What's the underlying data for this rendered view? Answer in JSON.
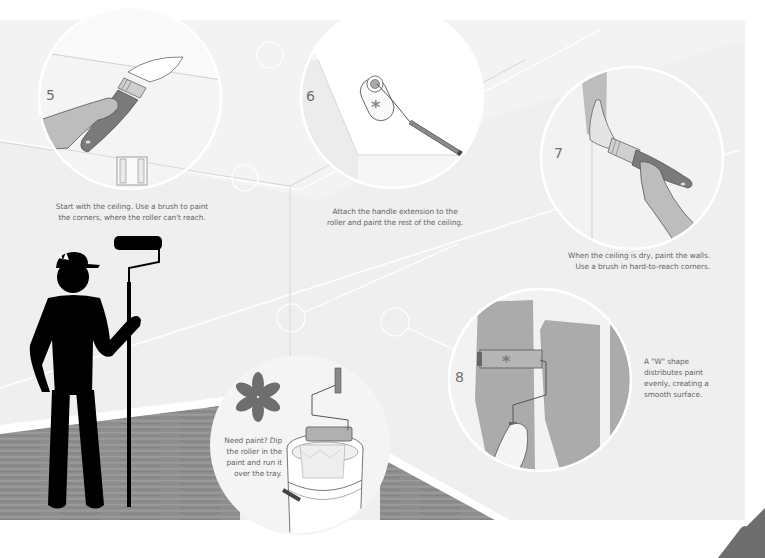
{
  "colors": {
    "background": "#ffffff",
    "wall": "#eeeeee",
    "wall_light": "#f5f5f5",
    "floor": "#8c8c8c",
    "floor_stripe": "#9a9a9a",
    "circle_fill": "#f8f8f8",
    "circle_border": "#ffffff",
    "paint_gray": "#a9a9a9",
    "accent_dark": "#6e6e6e",
    "silhouette": "#000000",
    "text": "#666666"
  },
  "steps": [
    {
      "number": "5",
      "caption_lines": [
        "Start with the ceiling. Use a brush to paint",
        "the corners, where the roller can't reach."
      ],
      "illustration": "hand-with-paintbrush-on-ceiling"
    },
    {
      "number": "6",
      "caption_lines": [
        "Attach the handle extension to the",
        "roller and paint the rest of the ceiling."
      ],
      "illustration": "roller-with-extension-handle"
    },
    {
      "number": "7",
      "caption_lines": [
        "When the ceiling is dry, paint the walls.",
        "Use a brush in hard-to-reach corners."
      ],
      "illustration": "hand-with-paintbrush-on-wall-corner"
    },
    {
      "number": "8",
      "caption_lines": [
        "A \"W\" shape",
        "distributes paint",
        "evenly, creating a",
        "smooth surface."
      ],
      "illustration": "roller-painting-w-shape"
    }
  ],
  "tip": {
    "icon": "asterisk-icon",
    "caption_lines": [
      "Need paint? Dip",
      "the roller in the",
      "paint and run it",
      "over the tray."
    ],
    "illustration": "roller-in-paint-bucket"
  },
  "figure": {
    "illustration": "painter-silhouette-holding-roller"
  },
  "page_corner": {
    "icon": "page-corner-triangle-icon"
  }
}
